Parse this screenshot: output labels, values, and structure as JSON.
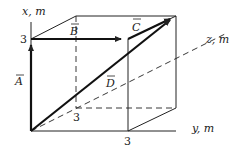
{
  "diagram": {
    "axes": {
      "x": {
        "label": "x, m",
        "tick": "3"
      },
      "y": {
        "label": "y, m",
        "tick": "3"
      },
      "z": {
        "label": "z, m",
        "tick": "3"
      }
    },
    "vectors": {
      "A": {
        "label": "A"
      },
      "B": {
        "label": "B"
      },
      "C": {
        "label": "C"
      },
      "D": {
        "label": "D"
      }
    },
    "colors": {
      "line": "#222222",
      "background": "#ffffff"
    }
  }
}
